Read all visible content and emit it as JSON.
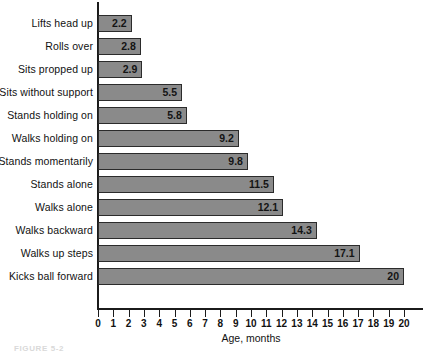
{
  "chart_data": {
    "type": "bar",
    "orientation": "horizontal",
    "title": "",
    "xlabel": "Age, months",
    "ylabel": "",
    "xlim": [
      0,
      20
    ],
    "grid": false,
    "legend": false,
    "categories": [
      "Lifts head up",
      "Rolls over",
      "Sits propped up",
      "Sits without support",
      "Stands holding on",
      "Walks holding on",
      "Stands momentarily",
      "Stands alone",
      "Walks alone",
      "Walks backward",
      "Walks up steps",
      "Kicks ball forward"
    ],
    "values": [
      2.2,
      2.8,
      2.9,
      5.5,
      5.8,
      9.2,
      9.8,
      11.5,
      12.1,
      14.3,
      17.1,
      20
    ],
    "value_labels": [
      "2.2",
      "2.8",
      "2.9",
      "5.5",
      "5.8",
      "9.2",
      "9.8",
      "11.5",
      "12.1",
      "14.3",
      "17.1",
      "20"
    ],
    "xticks": [
      0,
      1,
      2,
      3,
      4,
      5,
      6,
      7,
      8,
      9,
      10,
      11,
      12,
      13,
      14,
      15,
      16,
      17,
      18,
      19,
      20
    ],
    "xtick_labels": [
      "0",
      "1",
      "2",
      "3",
      "4",
      "5",
      "6",
      "7",
      "8",
      "9",
      "10",
      "11",
      "12",
      "13",
      "14",
      "15",
      "16",
      "17",
      "18",
      "19",
      "20"
    ],
    "bar_color": "#8a8a8a",
    "bar_edge_color": "#2b2b2b",
    "axis_color": "#1b1b1b",
    "text_color": "#111111",
    "background": "#ffffff"
  },
  "caption": {
    "text": "FIGURE 5-2"
  }
}
